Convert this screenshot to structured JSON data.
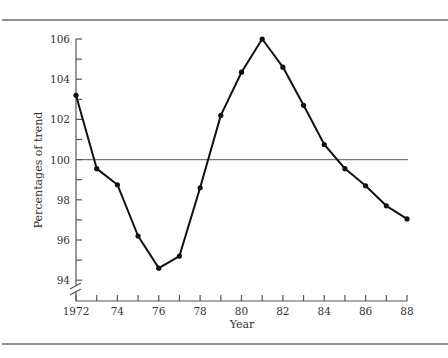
{
  "chart_data": {
    "type": "line",
    "title": "",
    "xlabel": "Year",
    "ylabel": "Percentages of trend",
    "x": [
      1972,
      1973,
      1974,
      1975,
      1976,
      1977,
      1978,
      1979,
      1980,
      1981,
      1982,
      1983,
      1984,
      1985,
      1986,
      1987,
      1988
    ],
    "series": [
      {
        "name": "Percentage of trend",
        "values": [
          103.2,
          99.55,
          98.75,
          96.2,
          94.6,
          95.2,
          98.6,
          102.2,
          104.35,
          106.0,
          104.6,
          102.7,
          100.75,
          99.55,
          98.7,
          97.7,
          97.05
        ]
      }
    ],
    "reference_line": {
      "y": 100
    },
    "xticks": [
      "1972",
      "74",
      "76",
      "78",
      "80",
      "82",
      "84",
      "86",
      "88"
    ],
    "yticks": [
      "94",
      "96",
      "98",
      "100",
      "102",
      "104",
      "106"
    ],
    "xlim": [
      1972,
      1988
    ],
    "ylim": [
      93,
      106
    ],
    "axis_break": "y-axis broken below 94",
    "grid": false,
    "legend": "none",
    "colors": {
      "line": "#111111",
      "reference": "#777777",
      "axis": "#555555"
    }
  }
}
